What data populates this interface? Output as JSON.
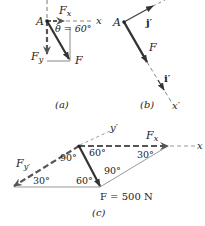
{
  "figure": {
    "panel_a": {
      "caption": "(a)",
      "point_label": "A",
      "axis_label": "x",
      "fx_label": "F",
      "fx_sub": "x",
      "fy_label": "F",
      "fy_sub": "y",
      "f_label": "F",
      "angle_label": "θ = 60°"
    },
    "panel_b": {
      "caption": "(b)",
      "point_label": "A",
      "j_label": "j′",
      "i_label": "i′",
      "f_label": "F",
      "axis_label": "x′"
    },
    "panel_c": {
      "caption": "(c)",
      "y_axis_label": "y′",
      "x_axis_label": "x",
      "fx_label": "F",
      "fx_sub": "x",
      "fy_label": "F",
      "fy_sub": "y′",
      "force_label": "F = 500 N",
      "angles": [
        "30°",
        "60°",
        "90°",
        "90°",
        "60°",
        "30°"
      ]
    },
    "colors": {
      "line": "#333333",
      "light_line": "#888888",
      "dashed": "#555555"
    }
  }
}
